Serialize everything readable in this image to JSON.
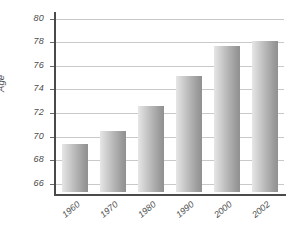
{
  "chart_data": {
    "type": "bar",
    "title": "",
    "subtitle": "",
    "xlabel": "",
    "ylabel": "Age",
    "categories": [
      "1960",
      "1970",
      "1980",
      "1990",
      "2000",
      "2002"
    ],
    "values": [
      69.4,
      70.5,
      72.6,
      75.1,
      77.7,
      78.1
    ],
    "series": [
      {
        "name": "Age",
        "values": [
          69.4,
          70.5,
          72.6,
          75.1,
          77.7,
          78.1
        ]
      }
    ],
    "ylim": [
      65.3,
      80.4
    ],
    "ytick_labels": [
      "66",
      "68",
      "70",
      "72",
      "74",
      "76",
      "78",
      "80"
    ],
    "ytick_values": [
      66,
      68,
      70,
      72,
      74,
      76,
      78,
      80
    ],
    "grid": true,
    "legend": false,
    "legend_position": "none",
    "bar_fill_start_color": "#e6e6e6",
    "bar_fill_end_color": "#909090",
    "gridline_color": "#c9c9c9",
    "axis_color": "#4a4a4a",
    "text_color": "#4d4d4d",
    "background_color": "#ffffff"
  }
}
